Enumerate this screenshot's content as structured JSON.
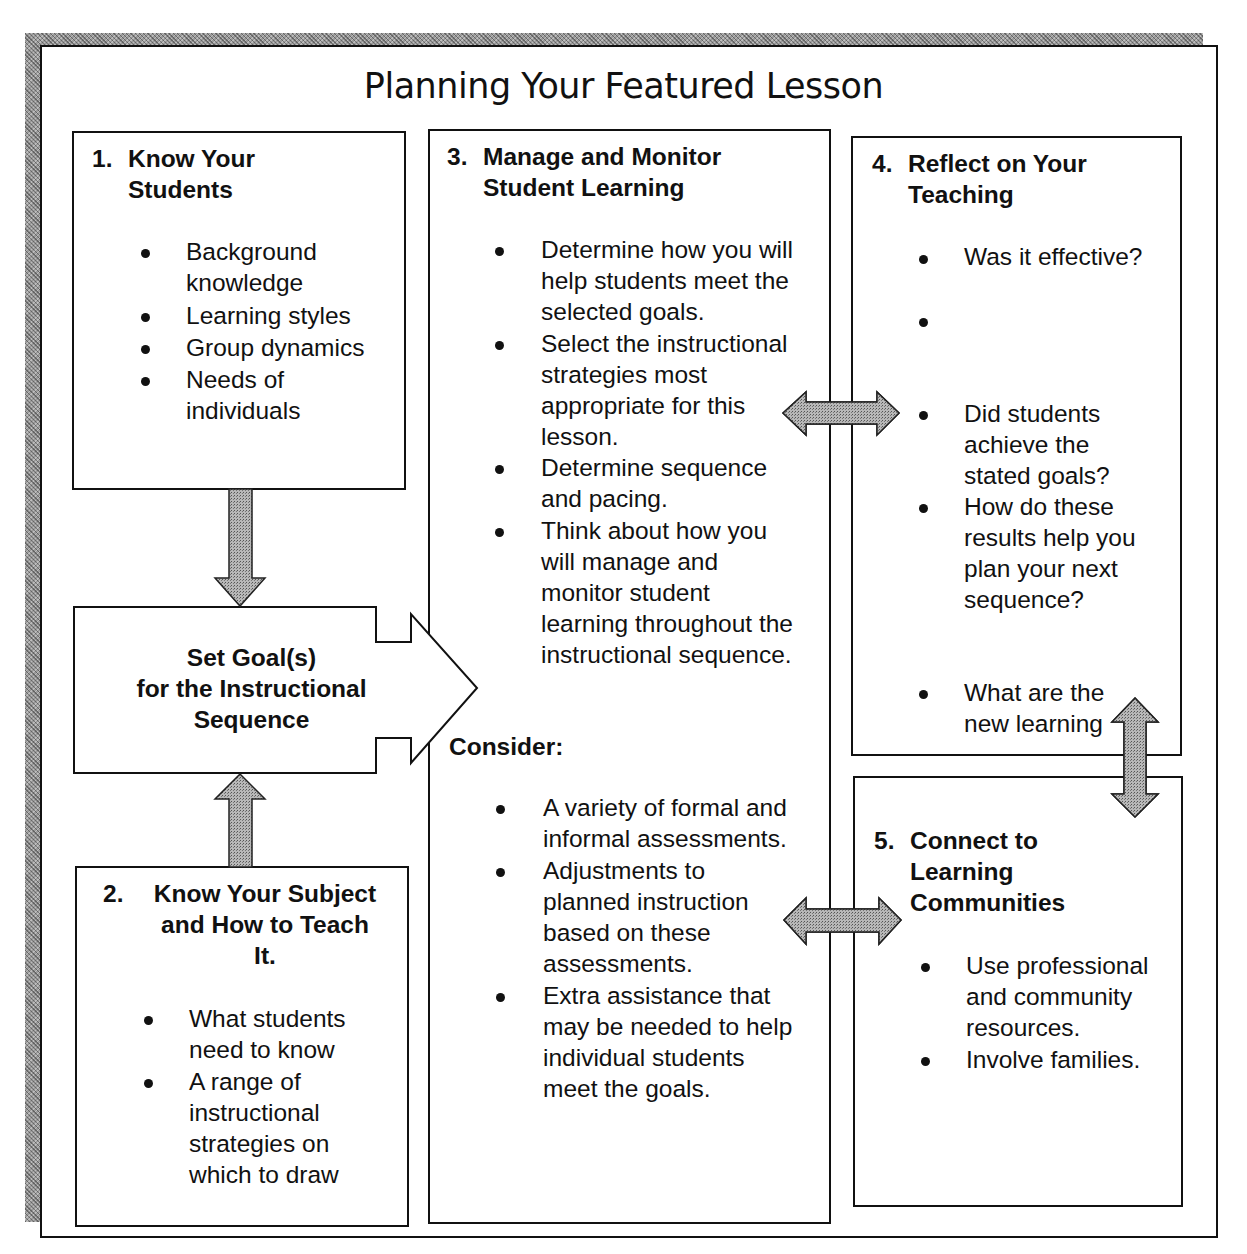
{
  "title": "Planning Your Featured Lesson",
  "colors": {
    "arrow_fill": "#9a9a9a",
    "border": "#111111",
    "background": "#ffffff"
  },
  "box1": {
    "number": "1.",
    "heading": "Know Your\nStudents",
    "items": [
      "Background\nknowledge",
      "Learning styles",
      "Group dynamics",
      "Needs of\nindividuals"
    ]
  },
  "goal_box": {
    "text": "Set Goal(s)\nfor the Instructional\nSequence"
  },
  "box2": {
    "number": "2.",
    "heading": "Know Your Subject\nand How to Teach\nIt.",
    "items": [
      "What students\nneed to know",
      "A range of\ninstructional\nstrategies on\nwhich to draw"
    ]
  },
  "box3": {
    "number": "3.",
    "heading": "Manage and Monitor\nStudent Learning",
    "items": [
      "Determine how you will\nhelp students meet the\nselected goals.",
      "Select the instructional\nstrategies most\nappropriate for this\nlesson.",
      "Determine sequence\nand pacing.",
      "Think about how you\nwill manage and\nmonitor student\nlearning throughout the\ninstructional sequence."
    ],
    "consider_label": "Consider:",
    "consider_items": [
      "A variety of formal and\ninformal assessments.",
      "Adjustments to\nplanned instruction\nbased on these\nassessments.",
      "Extra assistance that\nmay be needed to help\nindividual students\nmeet the goals."
    ]
  },
  "box4": {
    "number": "4.",
    "heading": "Reflect on Your\nTeaching",
    "items": [
      "Was it effective?",
      "",
      "Did students\nachieve the\nstated goals?",
      "How do these\nresults help you\nplan your next\nsequence?",
      "What are the\nnew learning"
    ]
  },
  "box5": {
    "number": "5.",
    "heading": "Connect to\nLearning\nCommunities",
    "items": [
      "Use professional\nand community\nresources.",
      "Involve families."
    ]
  },
  "arrows": [
    {
      "name": "arrow-box1-to-goal",
      "direction": "down"
    },
    {
      "name": "arrow-box2-to-goal",
      "direction": "up"
    },
    {
      "name": "arrow-goal-to-box3",
      "direction": "right"
    },
    {
      "name": "arrow-box3-box4",
      "direction": "left-right"
    },
    {
      "name": "arrow-box3-box5",
      "direction": "left-right"
    },
    {
      "name": "arrow-box4-box5",
      "direction": "up-down"
    }
  ]
}
